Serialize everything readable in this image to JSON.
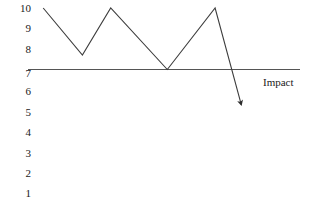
{
  "chart_data": {
    "type": "line",
    "title": "",
    "subtitle": "",
    "xlabel": "",
    "ylabel": "",
    "axis_line_label": "Impact",
    "grid": false,
    "legend": null,
    "y_tick_labels": [
      "10",
      "9",
      "8",
      "7",
      "6",
      "5",
      "4",
      "3",
      "2",
      "1"
    ],
    "y_tick_values": [
      10,
      9,
      8,
      7,
      6,
      5,
      4,
      3,
      2,
      1
    ],
    "ylim": [
      0.5,
      10.5
    ],
    "x_tick_labels": [],
    "xlim": [
      0,
      10
    ],
    "baseline_value": 7,
    "series": [
      {
        "name": "impact-trend",
        "points": [
          {
            "x": 0.7,
            "y": 10.0
          },
          {
            "x": 2.5,
            "y": 7.7
          },
          {
            "x": 3.8,
            "y": 10.0
          },
          {
            "x": 6.4,
            "y": 7.0
          },
          {
            "x": 8.6,
            "y": 10.0
          },
          {
            "x": 9.8,
            "y": 5.3
          }
        ],
        "values": [
          10.0,
          7.7,
          10.0,
          7.0,
          10.0,
          5.3
        ],
        "arrow_end": true,
        "color": "#3d3d3d"
      }
    ],
    "annotations": [
      {
        "name": "arrowhead",
        "x": 9.8,
        "y": 5.3
      }
    ],
    "colors": {
      "background": "#ffffff",
      "line": "#3d3d3d",
      "axis": "#4a4a4a",
      "text": "#1a1a1a"
    }
  },
  "ticks": {
    "t0": "10",
    "t1": "9",
    "t2": "8",
    "t3": "7",
    "t4": "6",
    "t5": "5",
    "t6": "4",
    "t7": "3",
    "t8": "2",
    "t9": "1"
  },
  "labels": {
    "impact": "Impact"
  }
}
